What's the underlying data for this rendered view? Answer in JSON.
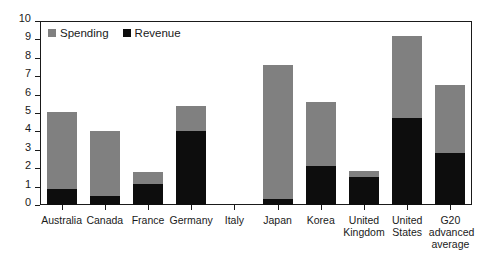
{
  "chart_data": {
    "type": "bar",
    "subtype": "stacked",
    "title": "",
    "subtitle": "",
    "xlabel": "",
    "ylabel": "",
    "ylim": [
      0,
      10
    ],
    "ytick_step": 1,
    "yticks": [
      "10",
      "9",
      "8",
      "7",
      "6",
      "5",
      "4",
      "3",
      "2",
      "1",
      "0"
    ],
    "grid": false,
    "legend_position": "top-left",
    "categories": [
      "Australia",
      "Canada",
      "France",
      "Germany",
      "Italy",
      "Japan",
      "Korea",
      "United Kingdom",
      "United States",
      "G20 advanced average"
    ],
    "series": [
      {
        "name": "Revenue",
        "color": "#0d0d0d",
        "values": [
          0.85,
          0.5,
          1.15,
          4.0,
          0.0,
          0.3,
          2.1,
          1.5,
          4.75,
          2.85
        ]
      },
      {
        "name": "Spending",
        "color": "#808080",
        "values": [
          4.2,
          3.5,
          0.65,
          1.4,
          0.0,
          7.3,
          3.5,
          0.35,
          4.45,
          3.65
        ]
      }
    ],
    "totals": [
      5.05,
      4.0,
      1.8,
      5.4,
      0.0,
      7.6,
      5.6,
      1.85,
      9.2,
      6.5
    ],
    "annotations": []
  },
  "legend": {
    "items": [
      {
        "label": "Spending",
        "swatch": "gray-square-icon"
      },
      {
        "label": "Revenue",
        "swatch": "black-square-icon"
      }
    ]
  },
  "colors": {
    "spending": "#808080",
    "revenue": "#0d0d0d",
    "axis": "#1a1a1a",
    "background": "#ffffff"
  }
}
